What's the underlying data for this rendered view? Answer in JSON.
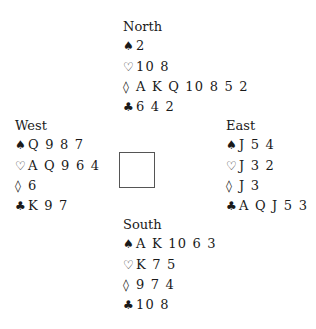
{
  "hands": {
    "north": {
      "player": "North",
      "spades": "2",
      "hearts": "10 8",
      "diamonds": "A K Q 10 8 5 2",
      "clubs": "6 4 2"
    },
    "west": {
      "player": "West",
      "spades": "Q 9 8 7",
      "hearts": "A Q 9 6 4",
      "diamonds": "6",
      "clubs": "K 9 7"
    },
    "east": {
      "player": "East",
      "spades": "J 5 4",
      "hearts": "J 3 2",
      "diamonds": "J 3",
      "clubs": "A Q J 5 3"
    },
    "south": {
      "player": "South",
      "spades": "A K 10 6 3",
      "hearts": "K 7 5",
      "diamonds": "9 7 4",
      "clubs": "10 8"
    }
  },
  "suit_symbols": {
    "spades": "♠",
    "hearts": "♡",
    "diamonds": "◊",
    "clubs": "♣"
  }
}
